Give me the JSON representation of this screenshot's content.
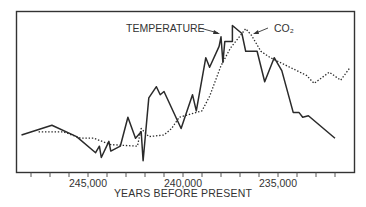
{
  "chart_data": {
    "type": "line",
    "title": "",
    "xlabel": "YEARS BEFORE PRESENT",
    "ylabel": "",
    "x_ticks": [
      {
        "label": "245,000",
        "value": 245000
      },
      {
        "label": "240,000",
        "value": 240000
      },
      {
        "label": "235,000",
        "value": 235000
      }
    ],
    "minor_tick_interval": 1000,
    "xlim": [
      248000,
      231000
    ],
    "x_reversed": true,
    "ylim": [
      0,
      100
    ],
    "y_units": "relative (no y-axis labels shown)",
    "grid": false,
    "legend_position": "inline annotations near peak",
    "annotations": [
      {
        "text": "TEMPERATURE",
        "points_to": "temperature peak"
      },
      {
        "text": "CO₂",
        "points_to": "CO2 peak"
      }
    ],
    "series": [
      {
        "name": "Temperature",
        "style": "solid",
        "color": "#2a2a2a",
        "x": [
          248500,
          246900,
          245600,
          244600,
          244400,
          244300,
          243900,
          243800,
          243300,
          242900,
          242500,
          242200,
          242100,
          241800,
          241400,
          241200,
          241000,
          240100,
          239500,
          239300,
          238800,
          238600,
          238100,
          238000,
          237900,
          237800,
          237400,
          237400,
          236900,
          236700,
          236100,
          235700,
          235200,
          234800,
          234200,
          233900,
          233700,
          233400,
          232000
        ],
        "values": [
          23,
          29,
          22,
          12,
          16,
          9,
          19,
          13,
          16,
          34,
          21,
          25,
          7,
          46,
          53,
          48,
          50,
          27,
          48,
          38,
          71,
          65,
          78,
          84,
          68,
          81,
          81,
          91,
          86,
          75,
          75,
          56,
          71,
          63,
          37,
          37,
          34,
          35,
          21
        ]
      },
      {
        "name": "CO₂",
        "style": "dotted",
        "color": "#2a2a2a",
        "x": [
          247600,
          246300,
          245400,
          244700,
          243800,
          242400,
          242200,
          241800,
          241000,
          240600,
          240200,
          239000,
          238600,
          238000,
          237500,
          236700,
          236400,
          235900,
          235400,
          233500,
          233100,
          232300,
          231700,
          231200
        ],
        "values": [
          25,
          25,
          21,
          21,
          17,
          16,
          27,
          22,
          23,
          27,
          34,
          38,
          47,
          66,
          77,
          89,
          85,
          75,
          71,
          60,
          55,
          62,
          57,
          65
        ]
      }
    ]
  }
}
